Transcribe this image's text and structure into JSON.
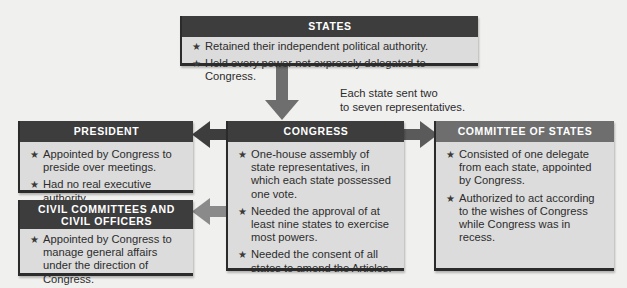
{
  "colors": {
    "background": "#f0f0ef",
    "box_fill": "#dcdcdc",
    "header_dark": "#3d3d3d",
    "header_mid": "#6e6e6e",
    "arrow_dark": "#3d3d3d",
    "arrow_mid": "#6e6e6e"
  },
  "states": {
    "title": "STATES",
    "items": [
      "Retained their independent political authority.",
      "Held every power not expressly delegated to Congress."
    ]
  },
  "representation_note": {
    "line1": "Each state sent two",
    "line2": "to seven representatives."
  },
  "president": {
    "title": "PRESIDENT",
    "items": [
      "Appointed by Congress to preside over meetings.",
      "Had no real executive authority."
    ]
  },
  "congress": {
    "title": "CONGRESS",
    "items": [
      "One-house assembly of state representatives, in which each state possessed one vote.",
      "Needed the approval of at least nine states to exercise most powers.",
      "Needed the consent of all states to amend the Articles."
    ]
  },
  "committee_of_states": {
    "title": "COMMITTEE OF STATES",
    "items": [
      "Consisted of one delegate from each state, appointed by Congress.",
      "Authorized to act according to the wishes of Congress while Congress was in recess."
    ]
  },
  "civil": {
    "title_line1": "CIVIL COMMITTEES AND",
    "title_line2": "CIVIL OFFICERS",
    "items": [
      "Appointed by Congress to manage general affairs under the direction of Congress."
    ]
  },
  "bullet_glyph": "★",
  "arrows": [
    {
      "from": "states",
      "to": "congress",
      "direction": "down"
    },
    {
      "from": "congress",
      "to": "president",
      "direction": "left"
    },
    {
      "from": "congress",
      "to": "committee_of_states",
      "direction": "right"
    },
    {
      "from": "congress",
      "to": "civil",
      "direction": "left"
    }
  ]
}
